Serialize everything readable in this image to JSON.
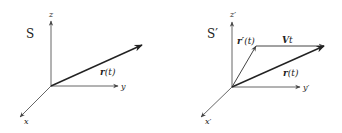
{
  "left": {
    "frame_label": "S",
    "axes": {
      "z": "z",
      "y": "y",
      "x": "x"
    },
    "vector": {
      "name": "r",
      "arg": "(t)"
    }
  },
  "right": {
    "frame_label": "S′",
    "axes": {
      "z": "z′",
      "y": "y′",
      "x": "x′"
    },
    "vectors": {
      "r_prime": {
        "name": "r′",
        "arg": "(t)"
      },
      "vt": {
        "name": "V",
        "suffix": "t"
      },
      "r": {
        "name": "r",
        "arg": "(t)"
      }
    }
  },
  "colors": {
    "axis": "#555555",
    "vector": "#222222",
    "background": "#ffffff"
  }
}
